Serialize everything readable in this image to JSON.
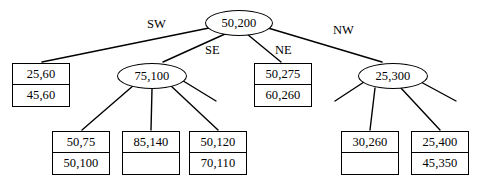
{
  "diagram": {
    "stroke_color": "#000000",
    "background_color": "#ffffff",
    "nodes": [
      {
        "id": "root",
        "shape": "ellipse",
        "label": "50,200",
        "x": 205,
        "y": 10,
        "w": 68,
        "h": 26
      },
      {
        "id": "sw-internal",
        "shape": "ellipse",
        "label": "75,100",
        "x": 117,
        "y": 63,
        "w": 70,
        "h": 26
      },
      {
        "id": "nw-internal",
        "shape": "ellipse",
        "label": "25,300",
        "x": 358,
        "y": 63,
        "w": 70,
        "h": 26
      }
    ],
    "leaves": [
      {
        "id": "leaf-sw",
        "top": "25,60",
        "bottom": "45,60",
        "x": 12,
        "y": 63,
        "w": 58,
        "h": 44
      },
      {
        "id": "leaf-ne",
        "top": "50,275",
        "bottom": "60,260",
        "x": 254,
        "y": 63,
        "w": 58,
        "h": 44
      },
      {
        "id": "leaf-5075",
        "top": "50,75",
        "bottom": "50,100",
        "x": 52,
        "y": 131,
        "w": 58,
        "h": 44
      },
      {
        "id": "leaf-85140",
        "top": "85,140",
        "bottom": "",
        "x": 122,
        "y": 131,
        "w": 58,
        "h": 44
      },
      {
        "id": "leaf-50120",
        "top": "50,120",
        "bottom": "70,110",
        "x": 189,
        "y": 131,
        "w": 58,
        "h": 44
      },
      {
        "id": "leaf-30260",
        "top": "30,260",
        "bottom": "",
        "x": 341,
        "y": 131,
        "w": 58,
        "h": 44
      },
      {
        "id": "leaf-25400",
        "top": "25,400",
        "bottom": "45,350",
        "x": 411,
        "y": 131,
        "w": 58,
        "h": 44
      }
    ],
    "edge_labels": [
      {
        "id": "label-sw",
        "text": "SW",
        "x": 147,
        "y": 18
      },
      {
        "id": "label-se",
        "text": "SE",
        "x": 205,
        "y": 44
      },
      {
        "id": "label-ne",
        "text": "NE",
        "x": 275,
        "y": 44
      },
      {
        "id": "label-nw",
        "text": "NW",
        "x": 333,
        "y": 24
      }
    ],
    "edges": [
      {
        "id": "edge-root-sw",
        "x1": 209,
        "y1": 28,
        "x2": 42,
        "y2": 62
      },
      {
        "id": "edge-root-se",
        "x1": 225,
        "y1": 34,
        "x2": 163,
        "y2": 62
      },
      {
        "id": "edge-root-ne",
        "x1": 247,
        "y1": 34,
        "x2": 281,
        "y2": 62
      },
      {
        "id": "edge-root-nw",
        "x1": 268,
        "y1": 28,
        "x2": 382,
        "y2": 62
      },
      {
        "id": "edge-sw-a",
        "x1": 134,
        "y1": 85,
        "x2": 82,
        "y2": 130
      },
      {
        "id": "edge-sw-b",
        "x1": 152,
        "y1": 89,
        "x2": 151,
        "y2": 130
      },
      {
        "id": "edge-sw-c",
        "x1": 170,
        "y1": 85,
        "x2": 218,
        "y2": 130
      },
      {
        "id": "edge-sw-stub",
        "x1": 180,
        "y1": 79,
        "x2": 216,
        "y2": 101
      },
      {
        "id": "edge-nw-stub-left",
        "x1": 364,
        "y1": 82,
        "x2": 335,
        "y2": 101
      },
      {
        "id": "edge-nw-a",
        "x1": 375,
        "y1": 88,
        "x2": 370,
        "y2": 130
      },
      {
        "id": "edge-nw-b",
        "x1": 400,
        "y1": 87,
        "x2": 440,
        "y2": 130
      },
      {
        "id": "edge-nw-stub-right",
        "x1": 419,
        "y1": 81,
        "x2": 456,
        "y2": 101
      }
    ]
  }
}
